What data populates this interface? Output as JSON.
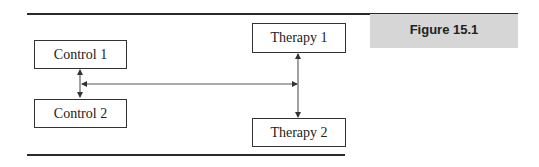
{
  "figure": {
    "label": "Figure 15.1"
  },
  "diagram": {
    "nodes": [
      {
        "id": "control1",
        "label": "Control 1"
      },
      {
        "id": "control2",
        "label": "Control 2"
      },
      {
        "id": "therapy1",
        "label": "Therapy 1"
      },
      {
        "id": "therapy2",
        "label": "Therapy 2"
      }
    ],
    "edges": [
      {
        "from": "control1",
        "to": "control2",
        "type": "bidirectional"
      },
      {
        "from": "control-link",
        "to": "therapy-link",
        "type": "bidirectional"
      },
      {
        "from": "therapy1",
        "to": "therapy2",
        "type": "bidirectional"
      }
    ]
  },
  "colors": {
    "rule": "#2a2a2a",
    "box_border": "#333333",
    "label_bg": "#d6d6d6"
  }
}
